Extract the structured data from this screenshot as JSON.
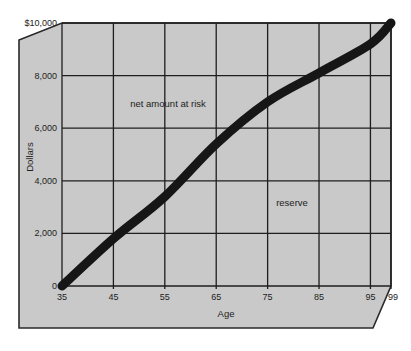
{
  "chart_data": {
    "type": "line",
    "title": "",
    "xlabel": "Age",
    "ylabel": "Dollars",
    "x": [
      35,
      45,
      55,
      65,
      75,
      85,
      95,
      99
    ],
    "x_tick_labels": [
      "35",
      "45",
      "55",
      "65",
      "75",
      "85",
      "95",
      "99"
    ],
    "y_tick_values": [
      0,
      2000,
      4000,
      6000,
      8000,
      10000
    ],
    "y_tick_labels": [
      "0",
      "2,000",
      "4,000",
      "6,000",
      "8,000",
      "$10,000"
    ],
    "xlim": [
      35,
      99
    ],
    "ylim": [
      0,
      10000
    ],
    "grid": true,
    "legend": null,
    "series": [
      {
        "name": "reserve",
        "values": [
          0,
          1800,
          3400,
          5400,
          7000,
          8100,
          9200,
          10000
        ]
      }
    ],
    "annotations": [
      {
        "text": "net amount at risk",
        "region": "above curve",
        "x": 55,
        "y": 6800
      },
      {
        "text": "reserve",
        "region": "below curve",
        "x": 82,
        "y": 3200
      }
    ]
  },
  "colors": {
    "panel_fill": "#c9c9c9",
    "panel_border": "#2a2a2a",
    "grid": "#1e1e1e",
    "curve": "#161616"
  }
}
